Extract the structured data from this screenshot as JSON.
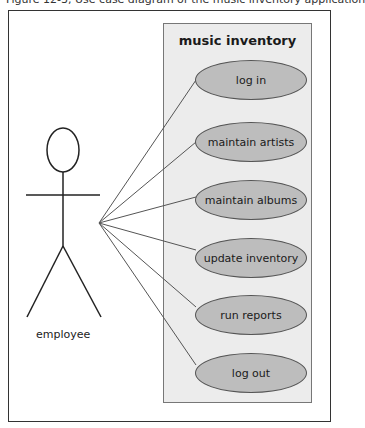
{
  "caption": "Figure 12-3, Use case diagram of the music inventory application",
  "system": {
    "title": "music inventory"
  },
  "actor": {
    "label": "employee"
  },
  "use_cases": [
    {
      "label": "log in",
      "top": 60
    },
    {
      "label": "maintain artists",
      "top": 122
    },
    {
      "label": "maintain albums",
      "top": 180
    },
    {
      "label": "update inventory",
      "top": 238
    },
    {
      "label": "run reports",
      "top": 295
    },
    {
      "label": "log out",
      "top": 353
    }
  ],
  "colors": {
    "system_fill": "#ececec",
    "usecase_fill": "#bdbdbd",
    "stroke": "#333333"
  }
}
